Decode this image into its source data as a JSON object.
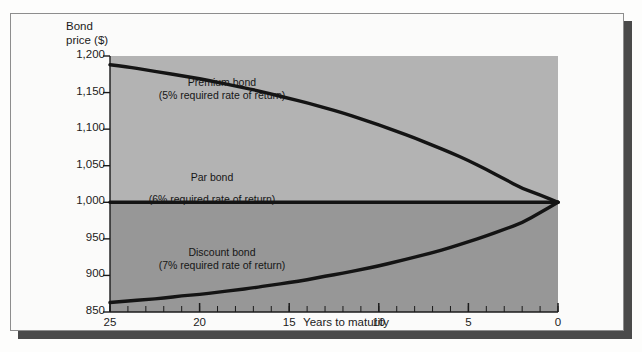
{
  "figure": {
    "y_axis_title_line1": "Bond",
    "y_axis_title_line2": "price ($)",
    "x_axis_title": "Years to maturity"
  },
  "chart_data": {
    "type": "line",
    "title": "",
    "xlabel": "Years to maturity",
    "ylabel": "Bond price ($)",
    "xlim": [
      25,
      0
    ],
    "ylim": [
      850,
      1200
    ],
    "x_reversed": true,
    "grid": false,
    "legend": "inline-annotations",
    "yticks": [
      850,
      900,
      950,
      1000,
      1050,
      1100,
      1150,
      1200
    ],
    "ytick_labels": [
      "850",
      "900",
      "950",
      "1,000",
      "1,050",
      "1,100",
      "1,150",
      "1,200"
    ],
    "xticks": [
      25,
      20,
      15,
      10,
      5,
      0
    ],
    "xtick_labels": [
      "25",
      "20",
      "15",
      "10",
      "5",
      "0"
    ],
    "x_minor_tick_interval": 1,
    "x": [
      25,
      24,
      23,
      22,
      21,
      20,
      19,
      18,
      17,
      16,
      15,
      14,
      13,
      12,
      11,
      10,
      9,
      8,
      7,
      6,
      5,
      4,
      3,
      2,
      1,
      0
    ],
    "series": [
      {
        "name": "Premium bond",
        "annotation_line1": "Premium bond",
        "annotation_line2": "(5% required rate of return)",
        "required_rate_of_return": "5%",
        "color": "#141414",
        "values": [
          1188,
          1185,
          1181,
          1177,
          1173,
          1169,
          1164,
          1159,
          1154,
          1148,
          1142,
          1136,
          1129,
          1122,
          1114,
          1106,
          1097,
          1088,
          1078,
          1068,
          1057,
          1045,
          1032,
          1019,
          1010,
          1000
        ]
      },
      {
        "name": "Par bond",
        "annotation_line1": "Par bond",
        "annotation_line2": "(6% required rate of return)",
        "required_rate_of_return": "6%",
        "color": "#141414",
        "values": [
          1000,
          1000,
          1000,
          1000,
          1000,
          1000,
          1000,
          1000,
          1000,
          1000,
          1000,
          1000,
          1000,
          1000,
          1000,
          1000,
          1000,
          1000,
          1000,
          1000,
          1000,
          1000,
          1000,
          1000,
          1000,
          1000
        ]
      },
      {
        "name": "Discount bond",
        "annotation_line1": "Discount bond",
        "annotation_line2": "(7% required rate of return)",
        "required_rate_of_return": "7%",
        "color": "#141414",
        "values": [
          863,
          865,
          867,
          869,
          872,
          874,
          877,
          880,
          883,
          887,
          890,
          894,
          899,
          903,
          908,
          913,
          919,
          925,
          931,
          938,
          946,
          954,
          963,
          972,
          986,
          1000
        ]
      }
    ],
    "shading": {
      "above_par_color": "#b3b3b3",
      "below_par_color": "#979797",
      "split_value": 1000
    }
  }
}
